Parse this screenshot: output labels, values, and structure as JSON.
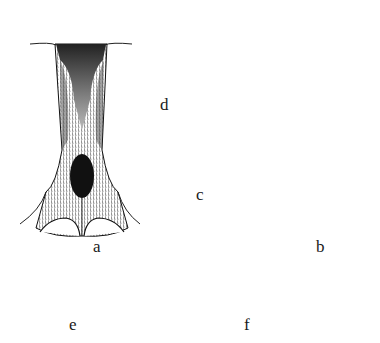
{
  "plate": {
    "figures": [
      {
        "id": "a",
        "label": "a",
        "description": "dark elongated structure with shaded median plate and lobed base"
      },
      {
        "id": "b",
        "label": "b",
        "description": "slender stalk with knob at top and dark lobed base"
      },
      {
        "id": "c",
        "label": "c",
        "description": "pale hairy club-shaped appendage"
      },
      {
        "id": "d",
        "label": "d",
        "description": "oval body covered with long bristles"
      },
      {
        "id": "e",
        "label": "e",
        "description": "dark segmented appendage with setose tip"
      },
      {
        "id": "f",
        "label": "f",
        "description": "dark segmented appendage with setose tip"
      }
    ]
  },
  "colors": {
    "ink": "#111111",
    "paper": "#ffffff"
  }
}
